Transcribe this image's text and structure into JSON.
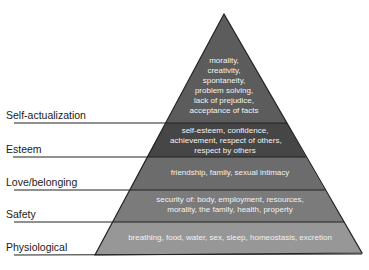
{
  "diagram": {
    "title": "",
    "type": "pyramid",
    "levels": [
      {
        "name": "Self-actualization",
        "description": [
          "morality,",
          "creativity,",
          "spontaneity,",
          "problem solving,",
          "lack of prejudice,",
          "acceptance of facts"
        ],
        "color": "#5c5c5c"
      },
      {
        "name": "Esteem",
        "description": [
          "self-esteem, confidence,",
          "achievement, respect of others,",
          "respect by others"
        ],
        "color": "#4a4a4a"
      },
      {
        "name": "Love/belonging",
        "description": [
          "friendship, family, sexual intimacy"
        ],
        "color": "#6e6e6e"
      },
      {
        "name": "Safety",
        "description": [
          "security of: body, employment, resources,",
          "morality, the family, health, property"
        ],
        "color": "#7a7a7a"
      },
      {
        "name": "Physiological",
        "description": [
          "breathing, food, water, sex, sleep, homeostasis, excretion"
        ],
        "color": "#969696"
      }
    ]
  }
}
